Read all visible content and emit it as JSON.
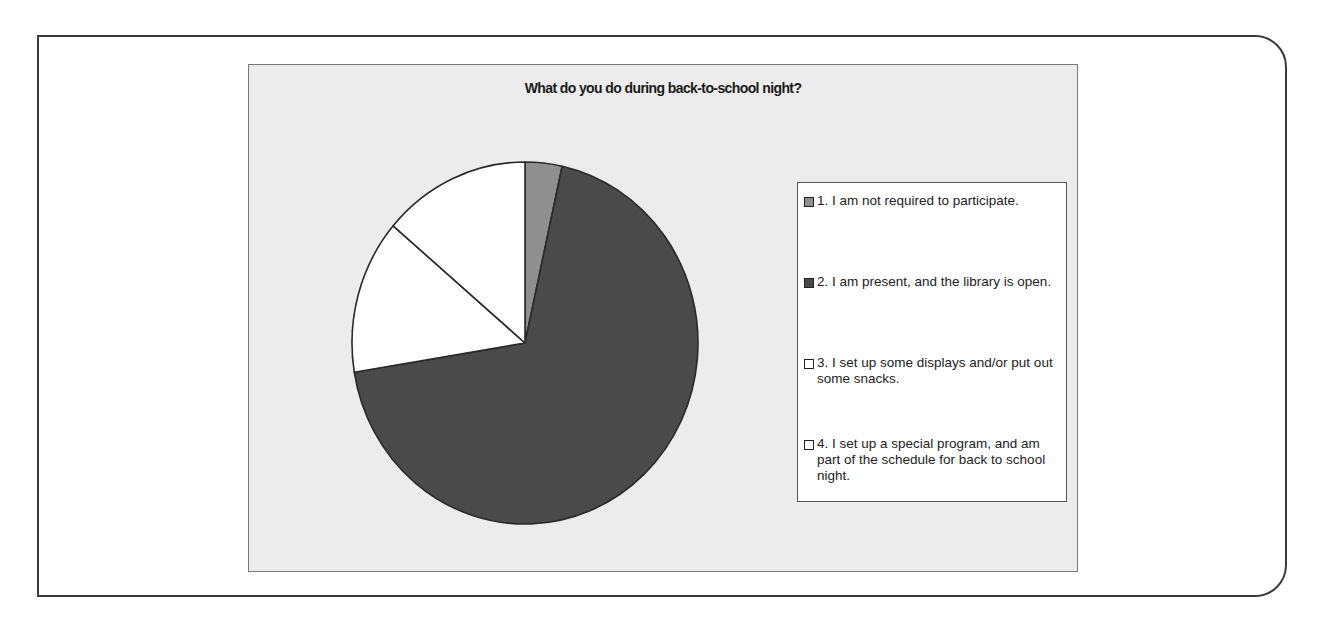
{
  "chart_data": {
    "type": "pie",
    "title": "What do you do during back-to-school night?",
    "categories": [
      "1. I am not required to participate.",
      "2. I am present, and the library is open.",
      "3. I set up some displays and/or put out some snacks.",
      "4. I set up a special program, and am part of the schedule for back to school night."
    ],
    "values": [
      1,
      20,
      4,
      4
    ],
    "percentages_estimated": [
      3.4,
      69.0,
      13.8,
      13.8
    ],
    "colors": [
      "#8f8f8f",
      "#4a4a4a",
      "#ffffff",
      "#ffffff"
    ],
    "legend_position": "right",
    "start_angle_deg": 0,
    "direction": "clockwise"
  },
  "legend": {
    "items": [
      {
        "label": "1. I am not required to participate.",
        "color": "#8f8f8f"
      },
      {
        "label": "2. I am present, and the library is open.",
        "color": "#4a4a4a"
      },
      {
        "label": "3. I set up some displays and/or put out some snacks.",
        "color": "#ffffff"
      },
      {
        "label": "4. I set up a special program, and am part of the schedule for back to school night.",
        "color": "#ffffff"
      }
    ]
  },
  "style": {
    "chart_bg": "#ececec",
    "slice_stroke": "#2a2a2a"
  }
}
